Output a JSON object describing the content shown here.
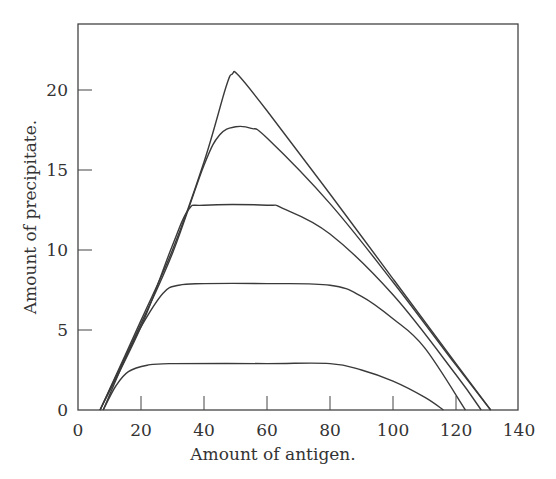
{
  "chart_data": {
    "type": "line",
    "title": "",
    "xlabel": "Amount of antigen.",
    "ylabel": "Amount of precipitate.",
    "xlim": [
      0,
      140
    ],
    "ylim": [
      0,
      24
    ],
    "xticks": [
      0,
      20,
      40,
      60,
      80,
      100,
      120,
      140
    ],
    "yticks": [
      0,
      5,
      10,
      15,
      20
    ],
    "grid": false,
    "legend": null,
    "series": [
      {
        "name": "curve-1",
        "points": [
          [
            7,
            0
          ],
          [
            20,
            5.6
          ],
          [
            30,
            10
          ],
          [
            40,
            15.5
          ],
          [
            47,
            20.2
          ],
          [
            49,
            21
          ],
          [
            51,
            20.9
          ],
          [
            60,
            18.7
          ],
          [
            80,
            13.5
          ],
          [
            100,
            8.2
          ],
          [
            120,
            2.9
          ],
          [
            131,
            0
          ]
        ]
      },
      {
        "name": "curve-2",
        "points": [
          [
            7,
            0
          ],
          [
            20,
            5.4
          ],
          [
            30,
            9.8
          ],
          [
            40,
            15.3
          ],
          [
            45,
            17.2
          ],
          [
            50,
            17.7
          ],
          [
            55,
            17.6
          ],
          [
            60,
            17
          ],
          [
            80,
            12.9
          ],
          [
            100,
            8
          ],
          [
            120,
            2.8
          ],
          [
            131,
            0
          ]
        ]
      },
      {
        "name": "curve-3",
        "points": [
          [
            7,
            0
          ],
          [
            20,
            5.2
          ],
          [
            30,
            10.3
          ],
          [
            35,
            12.5
          ],
          [
            40,
            12.8
          ],
          [
            60,
            12.8
          ],
          [
            65,
            12.6
          ],
          [
            80,
            11
          ],
          [
            100,
            7.2
          ],
          [
            120,
            2.2
          ],
          [
            128,
            0
          ]
        ]
      },
      {
        "name": "curve-4",
        "points": [
          [
            8,
            0
          ],
          [
            15,
            3.2
          ],
          [
            20,
            5.2
          ],
          [
            27,
            7.3
          ],
          [
            32,
            7.8
          ],
          [
            40,
            7.9
          ],
          [
            60,
            7.9
          ],
          [
            80,
            7.8
          ],
          [
            90,
            7.1
          ],
          [
            100,
            5.7
          ],
          [
            110,
            3.9
          ],
          [
            123,
            0
          ]
        ]
      },
      {
        "name": "curve-5",
        "points": [
          [
            8,
            0
          ],
          [
            12,
            1.5
          ],
          [
            16,
            2.4
          ],
          [
            22,
            2.8
          ],
          [
            30,
            2.9
          ],
          [
            60,
            2.9
          ],
          [
            80,
            2.9
          ],
          [
            90,
            2.5
          ],
          [
            100,
            1.8
          ],
          [
            110,
            0.8
          ],
          [
            116,
            0
          ]
        ]
      }
    ]
  },
  "axes": {
    "x_title": "Amount of antigen.",
    "y_title": "Amount of precipitate.",
    "x_tick_labels": [
      "0",
      "20",
      "40",
      "60",
      "80",
      "100",
      "120",
      "140"
    ],
    "y_tick_labels": [
      "0",
      "5",
      "10",
      "15",
      "20"
    ]
  }
}
